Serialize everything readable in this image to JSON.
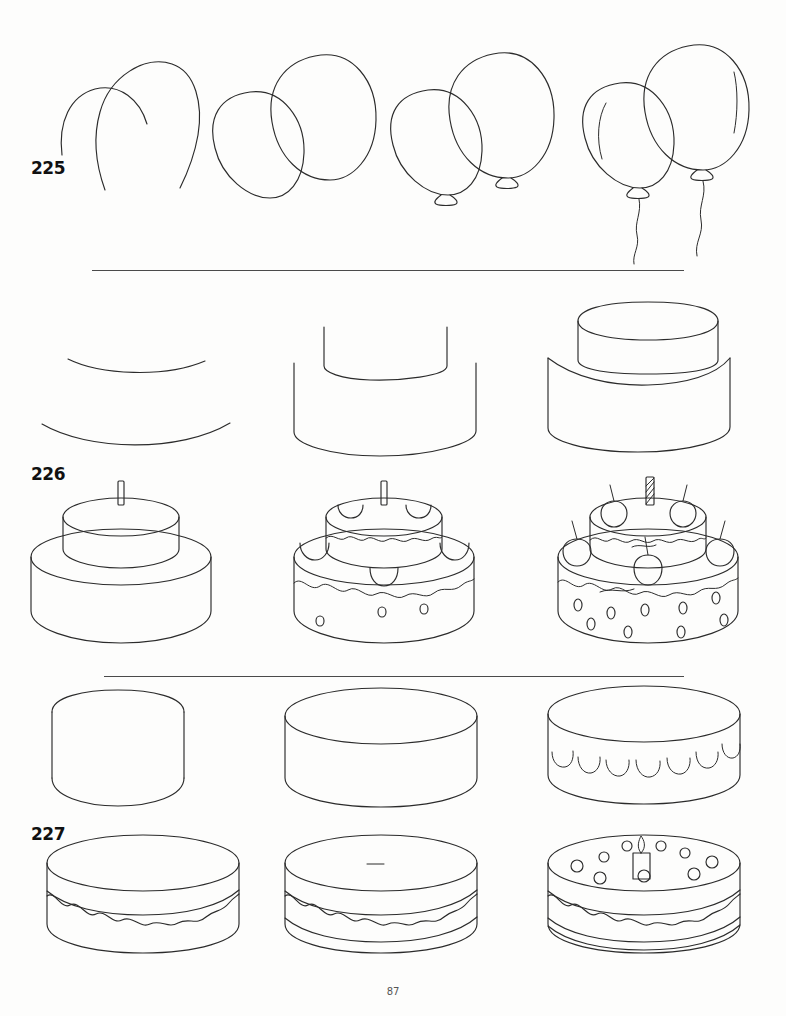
{
  "page": {
    "page_number": "87",
    "background_color": "#fdfdfc",
    "ink_color": "#2b2b2b"
  },
  "steps": [
    {
      "number": "225",
      "subject": "balloons",
      "panels": [
        {
          "label": "balloon-step-1",
          "description": "two partial arc outlines"
        },
        {
          "label": "balloon-step-2",
          "description": "two completed overlapping balloon ovals"
        },
        {
          "label": "balloon-step-3",
          "description": "balloons with knotted tie ends"
        },
        {
          "label": "balloon-step-4",
          "description": "balloons with highlights and curly strings"
        }
      ]
    },
    {
      "number": "226",
      "subject": "two-tier cake",
      "panels": [
        {
          "label": "tier-cake-step-1",
          "description": "two curved base arcs"
        },
        {
          "label": "tier-cake-step-2",
          "description": "two stacked cylinder walls"
        },
        {
          "label": "tier-cake-step-3",
          "description": "top tier ellipse over bottom tier"
        },
        {
          "label": "tier-cake-step-4",
          "description": "complete two-tier cake with single candle"
        },
        {
          "label": "tier-cake-step-5",
          "description": "cake with frosting drips, scallops and dots"
        },
        {
          "label": "tier-cake-step-6",
          "description": "finished cake with striped candle and cherries"
        }
      ]
    },
    {
      "number": "227",
      "subject": "round layer cake",
      "panels": [
        {
          "label": "round-cake-step-1",
          "description": "plain cylinder outline"
        },
        {
          "label": "round-cake-step-2",
          "description": "cylinder with top ellipse"
        },
        {
          "label": "round-cake-step-3",
          "description": "cake with scalloped frosting edge"
        },
        {
          "label": "round-cake-step-4",
          "description": "cake with wavy frosting drip band"
        },
        {
          "label": "round-cake-step-5",
          "description": "cake with added layer line"
        },
        {
          "label": "round-cake-step-6",
          "description": "finished cake with candle and sprinkle dots"
        }
      ]
    }
  ],
  "dividers": [
    {
      "name": "divider-after-balloons"
    },
    {
      "name": "divider-after-tier-cake"
    }
  ]
}
